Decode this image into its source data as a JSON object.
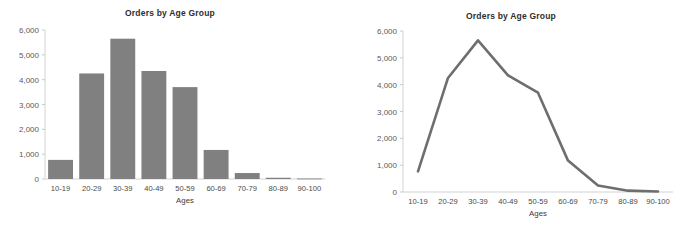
{
  "figure": {
    "background_color": "#ffffff",
    "series_color": "#808080",
    "line_color": "#6e6e6e",
    "axis_color": "#d3d3d3"
  },
  "panels": [
    {
      "id": "bar-panel",
      "title": "Orders by Age Group",
      "xlabel": "Ages",
      "ylabel": "",
      "ytick_labels": [
        "6,000",
        "5,000",
        "4,000",
        "3,000",
        "2,000",
        "1,000",
        "0"
      ],
      "xtick_labels": [
        "10-19",
        "20-29",
        "30-39",
        "40-49",
        "50-59",
        "60-69",
        "70-79",
        "80-89",
        "90-100"
      ]
    },
    {
      "id": "line-panel",
      "title": "Orders by Age Group",
      "xlabel": "Ages",
      "ylabel": "",
      "ytick_labels": [
        "6,000",
        "5,000",
        "4,000",
        "3,000",
        "2,000",
        "1,000",
        "0"
      ],
      "xtick_labels": [
        "10-19",
        "20-29",
        "30-39",
        "40-49",
        "50-59",
        "60-69",
        "70-79",
        "80-89",
        "90-100"
      ]
    }
  ],
  "chart_data": [
    {
      "type": "bar",
      "title": "Orders by Age Group",
      "xlabel": "Ages",
      "ylabel": "",
      "categories": [
        "10-19",
        "20-29",
        "30-39",
        "40-49",
        "50-59",
        "60-69",
        "70-79",
        "80-89",
        "90-100"
      ],
      "values": [
        770,
        4250,
        5650,
        4350,
        3700,
        1170,
        240,
        50,
        20
      ],
      "ylim": [
        0,
        6000
      ],
      "yticks": [
        0,
        1000,
        2000,
        3000,
        4000,
        5000,
        6000
      ],
      "grid": false,
      "legend": false
    },
    {
      "type": "line",
      "title": "Orders by Age Group",
      "xlabel": "Ages",
      "ylabel": "",
      "categories": [
        "10-19",
        "20-29",
        "30-39",
        "40-49",
        "50-59",
        "60-69",
        "70-79",
        "80-89",
        "90-100"
      ],
      "values": [
        770,
        4250,
        5650,
        4350,
        3700,
        1170,
        240,
        50,
        20
      ],
      "ylim": [
        0,
        6000
      ],
      "yticks": [
        0,
        1000,
        2000,
        3000,
        4000,
        5000,
        6000
      ],
      "grid": false,
      "legend": false
    }
  ]
}
